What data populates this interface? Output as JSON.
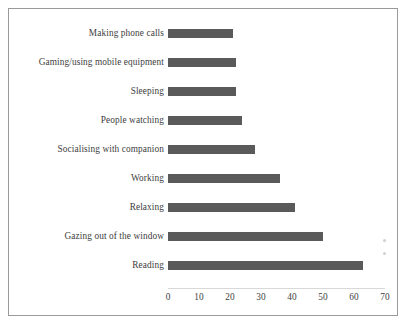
{
  "chart_data": {
    "type": "bar",
    "orientation": "horizontal",
    "title": "",
    "subtitle": "",
    "xlabel": "",
    "ylabel": "",
    "categories": [
      "Making phone calls",
      "Gaming/using mobile equipment",
      "Sleeping",
      "People watching",
      "Socialising with companion",
      "Working",
      "Relaxing",
      "Gazing out of the window",
      "Reading"
    ],
    "values": [
      21,
      22,
      22,
      24,
      28,
      36,
      41,
      50,
      63
    ],
    "xticks": [
      0,
      10,
      20,
      30,
      40,
      50,
      60,
      70
    ],
    "xtick_labels": [
      "0",
      "10",
      "20",
      "30",
      "40",
      "50",
      "60",
      "70"
    ],
    "xlim": [
      0,
      70
    ],
    "grid": false,
    "legend": false,
    "bar_color": "#5a5a5a",
    "text_color": "#3d3d3d",
    "border_color": "#9a9a9a",
    "background_color": "#ffffff"
  }
}
